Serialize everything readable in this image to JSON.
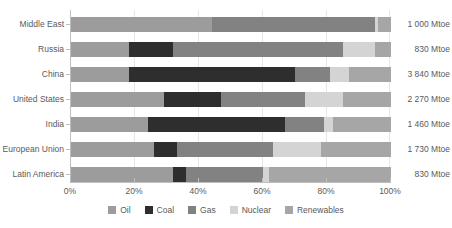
{
  "chart_data": {
    "type": "bar",
    "orientation": "horizontal",
    "stacked": true,
    "normalized": true,
    "title": "",
    "subtitle": "",
    "xlabel": "",
    "ylabel": "",
    "xlim": [
      0,
      100
    ],
    "grid": true,
    "legend_position": "bottom",
    "xtick_labels": [
      "0%",
      "20%",
      "40%",
      "60%",
      "80%",
      "100%"
    ],
    "xtick_values": [
      0,
      20,
      40,
      60,
      80,
      100
    ],
    "categories": [
      "Middle East",
      "Russia",
      "China",
      "United States",
      "India",
      "European Union",
      "Latin America"
    ],
    "series": [
      {
        "name": "Oil",
        "color": "#9c9c9c",
        "values": [
          44,
          18,
          18,
          29,
          24,
          26,
          32
        ]
      },
      {
        "name": "Coal",
        "color": "#2e2e2e",
        "values": [
          0,
          14,
          52,
          18,
          43,
          7,
          4
        ]
      },
      {
        "name": "Gas",
        "color": "#828282",
        "values": [
          51,
          53,
          11,
          26,
          12,
          30,
          24
        ]
      },
      {
        "name": "Nuclear",
        "color": "#d4d4d4",
        "values": [
          1,
          10,
          6,
          12,
          3,
          15,
          2
        ]
      },
      {
        "name": "Renewables",
        "color": "#a6a6a6",
        "values": [
          4,
          5,
          13,
          15,
          18,
          22,
          38
        ]
      }
    ],
    "value_labels": [
      "1 000 Mtoe",
      "830 Mtoe",
      "3 840 Mtoe",
      "2 270 Mtoe",
      "1 460 Mtoe",
      "1 730 Mtoe",
      "830 Mtoe"
    ],
    "value_label_unit": "Mtoe",
    "totals": [
      1000,
      830,
      3840,
      2270,
      1460,
      1730,
      830
    ]
  },
  "legend": {
    "items": [
      {
        "label": "Oil",
        "color": "#9c9c9c"
      },
      {
        "label": "Coal",
        "color": "#2e2e2e"
      },
      {
        "label": "Gas",
        "color": "#828282"
      },
      {
        "label": "Nuclear",
        "color": "#d4d4d4"
      },
      {
        "label": "Renewables",
        "color": "#a6a6a6"
      }
    ]
  },
  "colors": {
    "background": "#ffffff",
    "text": "#5a5a5a",
    "gridline": "#e6e6e6",
    "axis": "#bfbfbf"
  }
}
